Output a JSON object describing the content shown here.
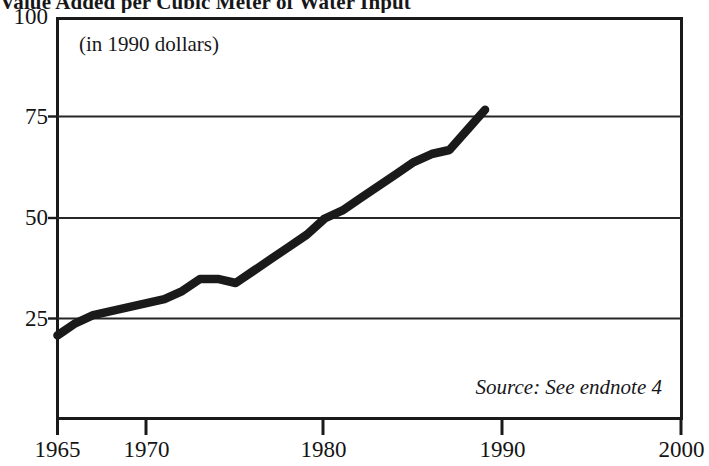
{
  "chart_data": {
    "type": "line",
    "title": "Value Added per Cubic Meter of Water Input",
    "subtitle": "(in 1990 dollars)",
    "source_note": "Source: See endnote 4",
    "xlabel": "",
    "ylabel": "",
    "xlim": [
      1965,
      2000
    ],
    "ylim": [
      0,
      100
    ],
    "grid": true,
    "legend": "none",
    "xticks": [
      "1965",
      "1970",
      "1980",
      "1990",
      "2000"
    ],
    "xtick_values": [
      1965,
      1970,
      1980,
      1990,
      2000
    ],
    "yticks": [
      "25",
      "50",
      "75",
      "100"
    ],
    "ytick_values": [
      25,
      50,
      75,
      100
    ],
    "series": [
      {
        "name": "Value added per cubic meter of water input",
        "color": "#1a1a1a",
        "x": [
          1965,
          1966,
          1967,
          1968,
          1969,
          1970,
          1971,
          1972,
          1973,
          1974,
          1975,
          1976,
          1977,
          1978,
          1979,
          1980,
          1981,
          1982,
          1983,
          1984,
          1985,
          1986,
          1987,
          1988,
          1989
        ],
        "values": [
          21,
          24,
          26,
          27,
          28,
          29,
          30,
          32,
          35,
          35,
          34,
          37,
          40,
          43,
          46,
          50,
          52,
          55,
          58,
          61,
          64,
          66,
          67,
          72,
          77
        ]
      }
    ]
  },
  "chart": {
    "title": "Value Added per Cubic Meter of Water Input",
    "units_note": "(in 1990 dollars)",
    "source_note": "Source: See endnote 4",
    "y_labels": [
      "100",
      "75",
      "50",
      "25"
    ],
    "x_labels": [
      "1965",
      "1970",
      "1980",
      "1990",
      "2000"
    ],
    "line_color": "#1a1a1a",
    "frame_color": "#1a1a1a",
    "grid_color": "#262626",
    "background": "#ffffff"
  }
}
